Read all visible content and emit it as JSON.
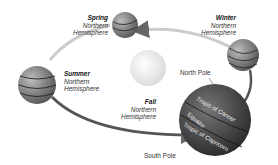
{
  "seasons": {
    "spring": {
      "title": "Spring",
      "line1": "Northern",
      "line2": "Hemisphere"
    },
    "winter": {
      "title": "Winter",
      "line1": "Northern",
      "line2": "Hemisphere"
    },
    "summer": {
      "title": "Summer",
      "line1": "Northern",
      "line2": "Hemisphere"
    },
    "fall": {
      "title": "Fall",
      "line1": "Northern",
      "line2": "Hemisphere"
    }
  },
  "earth_labels": {
    "north_pole": "North Pole",
    "south_pole": "South Pole",
    "tropic_cancer": "Tropic of Cancer",
    "equator": "Equator",
    "tropic_capricorn": "Tropic of Capricorn"
  },
  "colors": {
    "orbit": "#777777",
    "earth_dark": "#3a3a3a",
    "sun": "#f4f4f4"
  }
}
